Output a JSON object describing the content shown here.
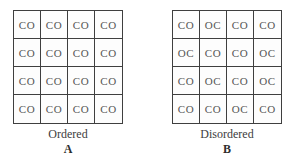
{
  "figure": {
    "panels": [
      {
        "caption": "Ordered",
        "label": "A",
        "grid": [
          [
            "CO",
            "CO",
            "CO",
            "CO"
          ],
          [
            "CO",
            "CO",
            "CO",
            "CO"
          ],
          [
            "CO",
            "CO",
            "CO",
            "CO"
          ],
          [
            "CO",
            "CO",
            "CO",
            "CO"
          ]
        ]
      },
      {
        "caption": "Disordered",
        "label": "B",
        "grid": [
          [
            "CO",
            "OC",
            "CO",
            "CO"
          ],
          [
            "OC",
            "CO",
            "CO",
            "OC"
          ],
          [
            "CO",
            "OC",
            "CO",
            "OC"
          ],
          [
            "CO",
            "CO",
            "OC",
            "CO"
          ]
        ]
      }
    ],
    "colors": {
      "background": "#ffffff",
      "line": "#3f3f3f",
      "text": "#555555"
    }
  }
}
